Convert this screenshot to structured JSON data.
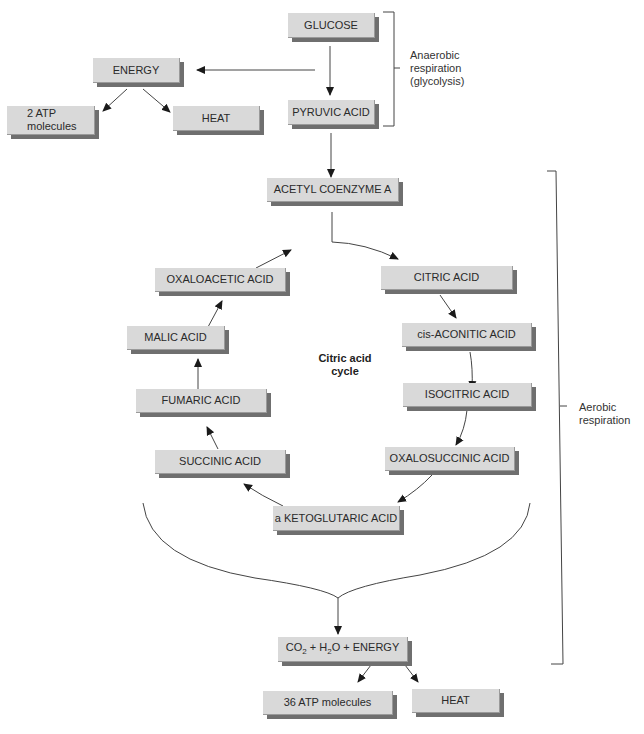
{
  "diagram": {
    "nodes": {
      "glucose": "GLUCOSE",
      "pyruvic_acid": "PYRUVIC ACID",
      "energy_top": "ENERGY",
      "atp_2_line1": "2 ATP",
      "atp_2_line2": "molecules",
      "heat_top": "HEAT",
      "acetyl_coa": "ACETYL COENZYME A",
      "citric_acid": "CITRIC ACID",
      "cis_aconitic_acid": "cis-ACONITIC ACID",
      "isocitric_acid": "ISOCITRIC ACID",
      "oxalosuccinic_acid": "OXALOSUCCINIC ACID",
      "a_ketoglutaric_acid": "a KETOGLUTARIC ACID",
      "succinic_acid": "SUCCINIC ACID",
      "fumaric_acid": "FUMARIC ACID",
      "malic_acid": "MALIC ACID",
      "oxaloacetic_acid": "OXALOACETIC ACID",
      "final_co": "CO",
      "final_sub1": "2",
      "final_plus_h": " + H",
      "final_sub2": "2",
      "final_rest": "O + ENERGY",
      "atp_36": "36 ATP molecules",
      "heat_bottom": "HEAT"
    },
    "cycle_label_line1": "Citric acid",
    "cycle_label_line2": "cycle",
    "brackets": {
      "anaerobic_line1": "Anaerobic",
      "anaerobic_line2": "respiration",
      "anaerobic_line3": "(glycolysis)",
      "aerobic_line1": "Aerobic",
      "aerobic_line2": "respiration"
    },
    "colors": {
      "box_fill": "#d9d9d9",
      "box_shadow": "#6f6f6f",
      "line": "#333333"
    }
  }
}
